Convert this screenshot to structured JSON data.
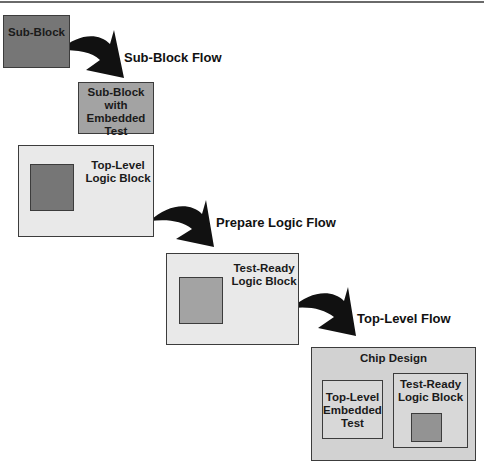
{
  "diagram": {
    "blocks": {
      "sub_block": {
        "label": "Sub-Block"
      },
      "sub_block_embedded": {
        "line1": "Sub-Block",
        "line2": "with",
        "line3": "Embedded",
        "line4": "Test"
      },
      "top_level_logic": {
        "line1": "Top-Level",
        "line2": "Logic Block"
      },
      "test_ready_logic": {
        "line1": "Test-Ready",
        "line2": "Logic Block"
      },
      "chip_design": {
        "label": "Chip Design",
        "embedded_test": {
          "line1": "Top-Level",
          "line2": "Embedded",
          "line3": "Test"
        },
        "test_ready": {
          "line1": "Test-Ready",
          "line2": "Logic Block"
        }
      }
    },
    "flows": [
      {
        "label": "Sub-Block Flow"
      },
      {
        "label": "Prepare Logic Flow"
      },
      {
        "label": "Top-Level Flow"
      }
    ],
    "colors": {
      "dark_block": "#767676",
      "medium_block": "#a3a3a3",
      "light_block": "#e9e9e9",
      "chip_block": "#d2d2d2",
      "arrow": "#111111"
    }
  }
}
